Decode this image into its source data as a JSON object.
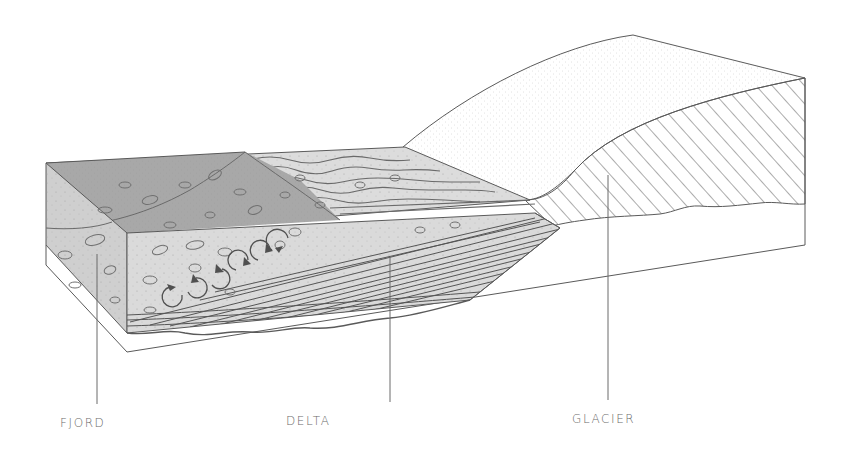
{
  "diagram": {
    "labels": [
      {
        "id": "fjord",
        "text": "FJORD",
        "x": 60,
        "y": 416,
        "line_x": 97,
        "line_top": 254,
        "line_bottom": 404
      },
      {
        "id": "delta",
        "text": "DELTA",
        "x": 286,
        "y": 414,
        "line_x": 390,
        "line_top": 257,
        "line_bottom": 402
      },
      {
        "id": "glacier",
        "text": "GLACIER",
        "x": 572,
        "y": 412,
        "line_x": 608,
        "line_top": 175,
        "line_bottom": 400
      }
    ],
    "colors": {
      "stroke": "#5a5a5a",
      "water_dark": "#a9a9a9",
      "sediment_light": "#d9d9d9",
      "side_face": "#c9c9c9",
      "glacier_fill": "#ffffff",
      "label": "#6b6b6b"
    },
    "features": {
      "circulation_arrows": 6,
      "hatched_glacier_section": true,
      "delta_foreset_beds": true
    }
  }
}
